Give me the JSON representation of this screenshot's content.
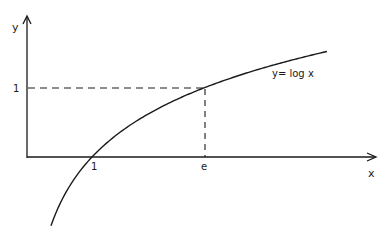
{
  "chart_data": {
    "type": "line",
    "title": "",
    "xlabel": "x",
    "ylabel": "y",
    "curve_label": "y= log x",
    "function": "y = ln(x)",
    "x_range": [
      0.369,
      4.615
    ],
    "y_range": [
      -1.0,
      1.53
    ],
    "xticks": [
      {
        "value": 1,
        "label": "1"
      },
      {
        "value": 2.718,
        "label": "e"
      }
    ],
    "yticks": [
      {
        "value": 1,
        "label": "1"
      }
    ],
    "annotations": [
      {
        "type": "dashed-guide",
        "from": [
          0,
          1
        ],
        "to": [
          2.718,
          1
        ]
      },
      {
        "type": "dashed-guide",
        "from": [
          2.718,
          0
        ],
        "to": [
          2.718,
          1
        ]
      }
    ],
    "series": [
      {
        "name": "y= log x",
        "x": [
          0.369,
          0.5,
          0.75,
          1,
          1.5,
          2,
          2.718,
          3.5,
          4.615
        ],
        "values": [
          -1.0,
          -0.693,
          -0.288,
          0,
          0.405,
          0.693,
          1.0,
          1.253,
          1.53
        ]
      }
    ],
    "grid": false,
    "legend": "none"
  },
  "labels": {
    "y_axis": "y",
    "x_axis": "x",
    "y_tick_1": "1",
    "x_tick_1": "1",
    "x_tick_e": "e",
    "curve": "y= log x"
  }
}
